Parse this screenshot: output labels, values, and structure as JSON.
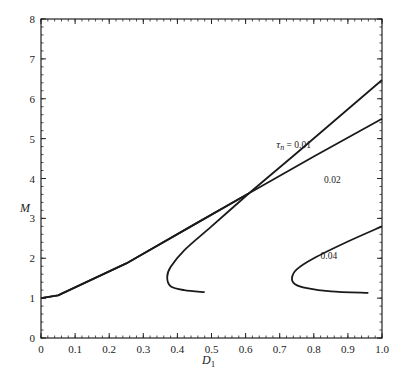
{
  "chart_data": {
    "type": "line",
    "title": "",
    "xlabel": "D1",
    "xlabel_main": "D",
    "xlabel_sub": "1",
    "ylabel": "M",
    "xlim": [
      0,
      1.0
    ],
    "ylim": [
      0,
      8
    ],
    "xticks": [
      "0",
      "0.1",
      "0.2",
      "0.3",
      "0.4",
      "0.5",
      "0.6",
      "0.7",
      "0.8",
      "0.9",
      "1.0"
    ],
    "yticks": [
      "0",
      "1",
      "2",
      "3",
      "4",
      "5",
      "6",
      "7",
      "8"
    ],
    "grid": false,
    "legend": "inline curve labels",
    "series": [
      {
        "name": "τn = 0.01",
        "label": "τn = 0.01",
        "label_pos": [
          0.69,
          4.76
        ],
        "points": [
          [
            0.0,
            1.0
          ],
          [
            0.05,
            1.07
          ],
          [
            0.25,
            1.87
          ],
          [
            0.45,
            2.85
          ],
          [
            0.61,
            3.63
          ],
          [
            0.75,
            4.64
          ],
          [
            1.0,
            6.47
          ]
        ],
        "branch_points": [
          [
            0.48,
            1.15
          ],
          [
            0.42,
            1.2
          ],
          [
            0.38,
            1.3
          ],
          [
            0.37,
            1.53
          ],
          [
            0.38,
            1.78
          ],
          [
            0.42,
            2.2
          ],
          [
            0.5,
            2.8
          ],
          [
            0.61,
            3.63
          ]
        ]
      },
      {
        "name": "0.02",
        "label": "0.02",
        "label_pos": [
          0.83,
          3.88
        ],
        "points": [
          [
            0.0,
            1.0
          ],
          [
            0.05,
            1.07
          ],
          [
            0.25,
            1.87
          ],
          [
            0.45,
            2.85
          ],
          [
            0.61,
            3.63
          ],
          [
            0.8,
            4.55
          ],
          [
            1.0,
            5.5
          ]
        ]
      },
      {
        "name": "0.04",
        "label": "0.04",
        "label_pos": [
          0.82,
          1.97
        ],
        "points": [
          [
            0.96,
            1.13
          ],
          [
            0.85,
            1.17
          ],
          [
            0.78,
            1.25
          ],
          [
            0.745,
            1.35
          ],
          [
            0.736,
            1.5
          ],
          [
            0.75,
            1.72
          ],
          [
            0.8,
            2.0
          ],
          [
            0.9,
            2.42
          ],
          [
            1.0,
            2.8
          ]
        ]
      }
    ]
  }
}
